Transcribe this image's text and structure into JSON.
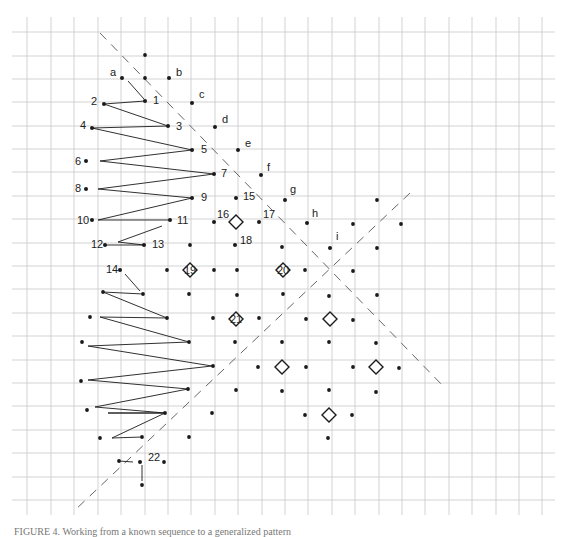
{
  "figure": {
    "caption": "FIGURE 4. Working from a known sequence to a generalized pattern",
    "colors": {
      "grid": "#c8c8c8",
      "ink": "#1a1a1a",
      "dash": "#666666",
      "background": "#ffffff"
    },
    "grid": {
      "x_lines": [
        27,
        51,
        74,
        98,
        121,
        145,
        168,
        191,
        215,
        238,
        262,
        285,
        308,
        332,
        355,
        379,
        402,
        425,
        449,
        472,
        496,
        519,
        542
      ],
      "y_lines": [
        32,
        56,
        79,
        102,
        126,
        149,
        172,
        196,
        219,
        243,
        266,
        289,
        313,
        336,
        360,
        383,
        406,
        430,
        453,
        477,
        500
      ],
      "x_min": 12,
      "x_max": 555,
      "y_min": 17,
      "y_max": 515
    },
    "labeled_points": [
      {
        "label": "a",
        "x": 122,
        "y": 78,
        "lx": 110,
        "ly": 76
      },
      {
        "label": "b",
        "x": 169,
        "y": 78,
        "lx": 176,
        "ly": 76
      },
      {
        "label": "1",
        "x": 145,
        "y": 101,
        "lx": 153,
        "ly": 104
      },
      {
        "label": "c",
        "x": 192,
        "y": 103,
        "lx": 199,
        "ly": 98
      },
      {
        "label": "2",
        "x": 104,
        "y": 104,
        "lx": 91,
        "ly": 105
      },
      {
        "label": "3",
        "x": 168,
        "y": 126,
        "lx": 176,
        "ly": 130
      },
      {
        "label": "d",
        "x": 215,
        "y": 127,
        "lx": 222,
        "ly": 123
      },
      {
        "label": "4",
        "x": 92,
        "y": 128,
        "lx": 80,
        "ly": 129
      },
      {
        "label": "5",
        "x": 192,
        "y": 150,
        "lx": 201,
        "ly": 153
      },
      {
        "label": "e",
        "x": 238,
        "y": 150,
        "lx": 245,
        "ly": 147
      },
      {
        "label": "6",
        "x": 86,
        "y": 161,
        "lx": 75,
        "ly": 165
      },
      {
        "label": "7",
        "x": 214,
        "y": 174,
        "lx": 221,
        "ly": 177
      },
      {
        "label": "f",
        "x": 261,
        "y": 175,
        "lx": 267,
        "ly": 171
      },
      {
        "label": "8",
        "x": 86,
        "y": 189,
        "lx": 75,
        "ly": 192
      },
      {
        "label": "9",
        "x": 192,
        "y": 198,
        "lx": 201,
        "ly": 201
      },
      {
        "label": "15",
        "x": 236,
        "y": 198,
        "lx": 243,
        "ly": 200
      },
      {
        "label": "g",
        "x": 285,
        "y": 200,
        "lx": 290,
        "ly": 193
      },
      {
        "label": "10",
        "x": 92,
        "y": 220,
        "lx": 77,
        "ly": 224
      },
      {
        "label": "11",
        "x": 170,
        "y": 220,
        "lx": 177,
        "ly": 224
      },
      {
        "label": "16",
        "x": 214,
        "y": 222,
        "lx": 217,
        "ly": 218
      },
      {
        "label": "17",
        "x": 259,
        "y": 222,
        "lx": 263,
        "ly": 218
      },
      {
        "label": "h",
        "x": 307,
        "y": 223,
        "lx": 312,
        "ly": 217
      },
      {
        "label": "12",
        "x": 105,
        "y": 245,
        "lx": 91,
        "ly": 248
      },
      {
        "label": "13",
        "x": 144,
        "y": 245,
        "lx": 152,
        "ly": 248
      },
      {
        "label": "18",
        "x": 235,
        "y": 245,
        "lx": 240,
        "ly": 244
      },
      {
        "label": "i",
        "x": 330,
        "y": 248,
        "lx": 336,
        "ly": 240
      },
      {
        "label": "14",
        "x": 120,
        "y": 270,
        "lx": 106,
        "ly": 273
      },
      {
        "label": "22",
        "x": 140,
        "y": 462,
        "lx": 148,
        "ly": 461
      }
    ],
    "plain_points": [
      [
        145,
        55
      ],
      [
        145,
        78
      ],
      [
        190,
        245
      ],
      [
        282,
        247
      ],
      [
        353,
        224
      ],
      [
        377,
        200
      ],
      [
        401,
        224
      ],
      [
        377,
        248
      ],
      [
        167,
        270
      ],
      [
        214,
        270
      ],
      [
        237,
        270
      ],
      [
        305,
        270
      ],
      [
        353,
        271
      ],
      [
        103,
        292
      ],
      [
        143,
        294
      ],
      [
        189,
        294
      ],
      [
        237,
        295
      ],
      [
        283,
        294
      ],
      [
        329,
        296
      ],
      [
        377,
        295
      ],
      [
        90,
        317
      ],
      [
        167,
        318
      ],
      [
        213,
        318
      ],
      [
        259,
        318
      ],
      [
        306,
        319
      ],
      [
        353,
        320
      ],
      [
        82,
        342
      ],
      [
        189,
        342
      ],
      [
        235,
        342
      ],
      [
        282,
        342
      ],
      [
        329,
        342
      ],
      [
        376,
        343
      ],
      [
        213,
        366
      ],
      [
        258,
        367
      ],
      [
        306,
        367
      ],
      [
        353,
        367
      ],
      [
        399,
        368
      ],
      [
        81,
        381
      ],
      [
        188,
        389
      ],
      [
        236,
        390
      ],
      [
        282,
        391
      ],
      [
        329,
        390
      ],
      [
        376,
        392
      ],
      [
        87,
        410
      ],
      [
        165,
        413
      ],
      [
        212,
        413
      ],
      [
        305,
        415
      ],
      [
        352,
        415
      ],
      [
        100,
        438
      ],
      [
        142,
        437
      ],
      [
        189,
        437
      ],
      [
        328,
        438
      ],
      [
        119,
        461
      ],
      [
        164,
        462
      ],
      [
        142,
        485
      ]
    ],
    "diamonds": [
      {
        "label": "",
        "x": 236,
        "y": 222
      },
      {
        "label": "19",
        "x": 190,
        "y": 270
      },
      {
        "label": "20",
        "x": 283,
        "y": 270
      },
      {
        "label": "21",
        "x": 236,
        "y": 319
      },
      {
        "label": "",
        "x": 330,
        "y": 319
      },
      {
        "label": "",
        "x": 282,
        "y": 367
      },
      {
        "label": "",
        "x": 376,
        "y": 367
      },
      {
        "label": "",
        "x": 329,
        "y": 415
      }
    ],
    "zigzag": [
      [
        145,
        101
      ],
      [
        104,
        104
      ],
      [
        168,
        126
      ],
      [
        92,
        128
      ],
      [
        192,
        150
      ],
      [
        100,
        161
      ],
      [
        214,
        174
      ],
      [
        98,
        189
      ],
      [
        192,
        198
      ],
      [
        98,
        220
      ],
      [
        170,
        220
      ]
    ],
    "zigzag2": [
      [
        162,
        226
      ],
      [
        118,
        242
      ],
      [
        144,
        245
      ],
      [
        106,
        245
      ]
    ],
    "zigzag3": [
      [
        143,
        294
      ],
      [
        103,
        292
      ],
      [
        167,
        318
      ],
      [
        100,
        317
      ],
      [
        189,
        342
      ],
      [
        88,
        346
      ],
      [
        212,
        366
      ],
      [
        88,
        380
      ],
      [
        188,
        389
      ],
      [
        95,
        407
      ],
      [
        165,
        413
      ],
      [
        108,
        413
      ],
      [
        165,
        413
      ],
      [
        112,
        438
      ],
      [
        142,
        437
      ]
    ],
    "extra_segments": [
      [
        [
          128,
          81
        ],
        [
          144,
          99
        ]
      ],
      [
        [
          125,
          274
        ],
        [
          140,
          291
        ]
      ],
      [
        [
          119,
          461
        ],
        [
          133,
          462
        ]
      ],
      [
        [
          142,
          465
        ],
        [
          142,
          481
        ]
      ]
    ],
    "dashed_lines": [
      {
        "name": "descending-diagonal",
        "x1": 100,
        "y1": 33,
        "x2": 445,
        "y2": 388
      },
      {
        "name": "ascending-diagonal",
        "x1": 410,
        "y1": 193,
        "x2": 74,
        "y2": 511
      }
    ]
  }
}
